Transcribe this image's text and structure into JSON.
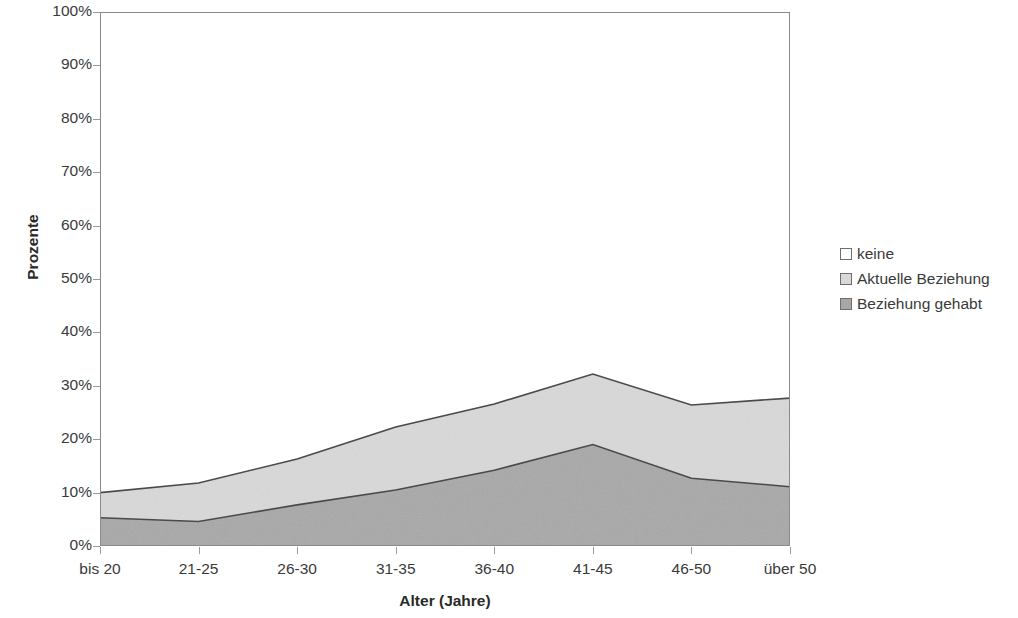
{
  "chart_data": {
    "type": "area",
    "stacked": true,
    "normalized_percent": true,
    "title": "",
    "xlabel": "Alter (Jahre)",
    "ylabel": "Prozente",
    "categories": [
      "bis 20",
      "21-25",
      "26-30",
      "31-35",
      "36-40",
      "41-45",
      "46-50",
      "über 50"
    ],
    "ylim": [
      0,
      100
    ],
    "ytick_labels": [
      "0%",
      "10%",
      "20%",
      "30%",
      "40%",
      "50%",
      "60%",
      "70%",
      "80%",
      "90%",
      "100%"
    ],
    "ytick_values": [
      0,
      10,
      20,
      30,
      40,
      50,
      60,
      70,
      80,
      90,
      100
    ],
    "grid": false,
    "legend_position": "right",
    "series": [
      {
        "name": "Beziehung gehabt",
        "color": "#a8a8a8",
        "values": [
          5.3,
          4.6,
          7.7,
          10.5,
          14.2,
          19.0,
          12.7,
          11.1
        ]
      },
      {
        "name": "Aktuelle Beziehung",
        "color": "#d9d9d9",
        "values": [
          4.7,
          7.2,
          8.6,
          11.8,
          12.4,
          13.2,
          13.7,
          16.6
        ]
      },
      {
        "name": "keine",
        "color": "#ffffff",
        "values": [
          90.0,
          88.2,
          83.7,
          77.7,
          73.4,
          67.8,
          73.6,
          72.3
        ]
      }
    ],
    "cumulative_tops": {
      "Beziehung gehabt": [
        5.3,
        4.6,
        7.7,
        10.5,
        14.2,
        19.0,
        12.7,
        11.1
      ],
      "Aktuelle Beziehung": [
        10.0,
        11.8,
        16.3,
        22.3,
        26.6,
        32.2,
        26.4,
        27.7
      ],
      "keine": [
        100,
        100,
        100,
        100,
        100,
        100,
        100,
        100
      ]
    }
  },
  "legend": {
    "entries": [
      {
        "label": "keine",
        "color": "#ffffff"
      },
      {
        "label": "Aktuelle Beziehung",
        "color": "#d9d9d9"
      },
      {
        "label": "Beziehung gehabt",
        "color": "#a8a8a8"
      }
    ]
  },
  "colors": {
    "axis": "#8a8a8a",
    "text": "#3a3a3a",
    "series_line": "#4a4a4a",
    "light_gray": "#d9d9d9",
    "dark_gray": "#a8a8a8",
    "white": "#ffffff"
  }
}
